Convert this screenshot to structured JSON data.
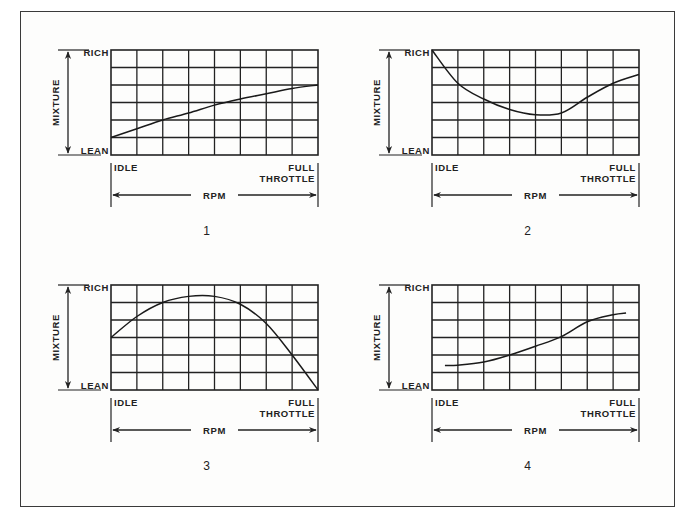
{
  "figure": {
    "panels": [
      {
        "number": "1",
        "labels": {
          "y_axis": "MIXTURE",
          "y_top": "RICH",
          "y_bottom": "LEAN",
          "x_left": "IDLE",
          "x_right_line1": "FULL",
          "x_right_line2": "THROTTLE",
          "x_axis": "RPM"
        },
        "grid": {
          "cols": 8,
          "rows": 6
        },
        "curve": [
          [
            0,
            1
          ],
          [
            1,
            1.5
          ],
          [
            2,
            2
          ],
          [
            3,
            2.4
          ],
          [
            4,
            2.85
          ],
          [
            5,
            3.2
          ],
          [
            6,
            3.5
          ],
          [
            7,
            3.8
          ],
          [
            8,
            4
          ]
        ]
      },
      {
        "number": "2",
        "labels": {
          "y_axis": "MIXTURE",
          "y_top": "RICH",
          "y_bottom": "LEAN",
          "x_left": "IDLE",
          "x_right_line1": "FULL",
          "x_right_line2": "THROTTLE",
          "x_axis": "RPM"
        },
        "grid": {
          "cols": 8,
          "rows": 6
        },
        "curve": [
          [
            0,
            6
          ],
          [
            1,
            4.1
          ],
          [
            2,
            3.2
          ],
          [
            3,
            2.6
          ],
          [
            4,
            2.3
          ],
          [
            5,
            2.4
          ],
          [
            6,
            3.3
          ],
          [
            7,
            4.1
          ],
          [
            8,
            4.6
          ]
        ]
      },
      {
        "number": "3",
        "labels": {
          "y_axis": "MIXTURE",
          "y_top": "RICH",
          "y_bottom": "LEAN",
          "x_left": "IDLE",
          "x_right_line1": "FULL",
          "x_right_line2": "THROTTLE",
          "x_axis": "RPM"
        },
        "grid": {
          "cols": 8,
          "rows": 6
        },
        "curve": [
          [
            0,
            3
          ],
          [
            1,
            4.2
          ],
          [
            2,
            5
          ],
          [
            3,
            5.35
          ],
          [
            4,
            5.35
          ],
          [
            5,
            4.9
          ],
          [
            6,
            3.8
          ],
          [
            7,
            2
          ],
          [
            8,
            0
          ]
        ]
      },
      {
        "number": "4",
        "labels": {
          "y_axis": "MIXTURE",
          "y_top": "RICH",
          "y_bottom": "LEAN",
          "x_left": "IDLE",
          "x_right_line1": "FULL",
          "x_right_line2": "THROTTLE",
          "x_axis": "RPM"
        },
        "grid": {
          "cols": 8,
          "rows": 6
        },
        "curve": [
          [
            0.5,
            1.4
          ],
          [
            1,
            1.42
          ],
          [
            2,
            1.6
          ],
          [
            3,
            2
          ],
          [
            4,
            2.5
          ],
          [
            5,
            3.05
          ],
          [
            6,
            3.9
          ],
          [
            7,
            4.3
          ],
          [
            7.5,
            4.4
          ]
        ]
      }
    ]
  },
  "chart_data": [
    {
      "type": "line",
      "title": "1",
      "xlabel": "RPM",
      "ylabel": "MIXTURE",
      "x_ticks": [
        "IDLE",
        "FULL THROTTLE"
      ],
      "y_ticks": [
        "LEAN",
        "RICH"
      ],
      "xlim": [
        0,
        8
      ],
      "ylim": [
        0,
        6
      ],
      "grid": true,
      "x": [
        0,
        1,
        2,
        3,
        4,
        5,
        6,
        7,
        8
      ],
      "values": [
        1,
        1.5,
        2,
        2.4,
        2.85,
        3.2,
        3.5,
        3.8,
        4
      ]
    },
    {
      "type": "line",
      "title": "2",
      "xlabel": "RPM",
      "ylabel": "MIXTURE",
      "x_ticks": [
        "IDLE",
        "FULL THROTTLE"
      ],
      "y_ticks": [
        "LEAN",
        "RICH"
      ],
      "xlim": [
        0,
        8
      ],
      "ylim": [
        0,
        6
      ],
      "grid": true,
      "x": [
        0,
        1,
        2,
        3,
        4,
        5,
        6,
        7,
        8
      ],
      "values": [
        6,
        4.1,
        3.2,
        2.6,
        2.3,
        2.4,
        3.3,
        4.1,
        4.6
      ]
    },
    {
      "type": "line",
      "title": "3",
      "xlabel": "RPM",
      "ylabel": "MIXTURE",
      "x_ticks": [
        "IDLE",
        "FULL THROTTLE"
      ],
      "y_ticks": [
        "LEAN",
        "RICH"
      ],
      "xlim": [
        0,
        8
      ],
      "ylim": [
        0,
        6
      ],
      "grid": true,
      "x": [
        0,
        1,
        2,
        3,
        4,
        5,
        6,
        7,
        8
      ],
      "values": [
        3,
        4.2,
        5,
        5.35,
        5.35,
        4.9,
        3.8,
        2,
        0
      ]
    },
    {
      "type": "line",
      "title": "4",
      "xlabel": "RPM",
      "ylabel": "MIXTURE",
      "x_ticks": [
        "IDLE",
        "FULL THROTTLE"
      ],
      "y_ticks": [
        "LEAN",
        "RICH"
      ],
      "xlim": [
        0,
        8
      ],
      "ylim": [
        0,
        6
      ],
      "grid": true,
      "x": [
        0.5,
        1,
        2,
        3,
        4,
        5,
        6,
        7,
        7.5
      ],
      "values": [
        1.4,
        1.42,
        1.6,
        2,
        2.5,
        3.05,
        3.9,
        4.3,
        4.4
      ]
    }
  ]
}
